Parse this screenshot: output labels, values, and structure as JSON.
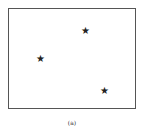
{
  "figure": {
    "caption": "(a)",
    "marker_glyph": "★",
    "points": [
      {
        "x": 40,
        "y": 59
      },
      {
        "x": 85,
        "y": 31
      },
      {
        "x": 104,
        "y": 91
      }
    ]
  }
}
